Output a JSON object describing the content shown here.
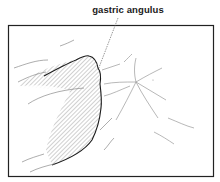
{
  "figure": {
    "label": "gastric  angulus",
    "colors": {
      "frame": "#222222",
      "outline": "#1a1a1a",
      "hatch": "#777777",
      "folds": "#9a9a9a",
      "background": "#ffffff"
    }
  }
}
